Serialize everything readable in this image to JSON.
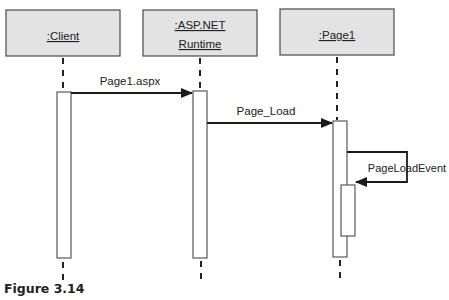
{
  "diagram": {
    "type": "UML sequence diagram",
    "objects": [
      {
        "id": "client",
        "label": ":Client"
      },
      {
        "id": "runtime",
        "label_line1": ":ASP.NET",
        "label_line2": "Runtime"
      },
      {
        "id": "page1",
        "label": ":Page1"
      }
    ],
    "messages": [
      {
        "from": "client",
        "to": "runtime",
        "label": "Page1.aspx"
      },
      {
        "from": "runtime",
        "to": "page1",
        "label": "Page_Load"
      },
      {
        "from": "page1",
        "to": "page1",
        "label": "PageLoadEvent"
      }
    ],
    "colors": {
      "object_fill": "#e3e3e3",
      "stroke": "#4a4a4a",
      "line": "#1a1a1a"
    }
  },
  "caption": "Figure 3.14"
}
